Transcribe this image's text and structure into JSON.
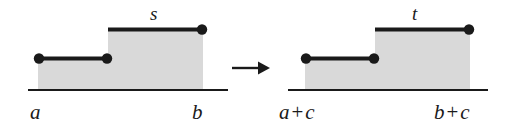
{
  "figure": {
    "background_color": "#ffffff",
    "ink_color": "#1a1a1a",
    "fill_color": "#d9d9d9",
    "panels": [
      {
        "name": "left-panel",
        "function_label": "s",
        "left_label": "a",
        "right_label": "b",
        "baseline": {
          "x1": 28,
          "x2": 228,
          "y": 90
        },
        "steps": [
          {
            "x1": 38,
            "x2": 108,
            "y": 58,
            "left_dot": true,
            "right_dot": true
          },
          {
            "x1": 108,
            "x2": 203,
            "y": 29,
            "left_dot": false,
            "right_dot": true
          }
        ]
      },
      {
        "name": "right-panel",
        "function_label": "t",
        "left_label": "a + c",
        "right_label": "b + c",
        "baseline": {
          "x1": 288,
          "x2": 488,
          "y": 90
        },
        "steps": [
          {
            "x1": 305,
            "x2": 375,
            "y": 58,
            "left_dot": true,
            "right_dot": true
          },
          {
            "x1": 375,
            "x2": 470,
            "y": 29,
            "left_dot": false,
            "right_dot": true
          }
        ]
      }
    ],
    "arrow": {
      "name": "transform-arrow",
      "x1": 232,
      "x2": 268,
      "y": 68
    },
    "labels": {
      "s": "s",
      "t": "t",
      "a": "a",
      "b": "b",
      "a_plus_c_lhs": "a",
      "a_plus_c_op": "+",
      "a_plus_c_rhs": "c",
      "b_plus_c_lhs": "b",
      "b_plus_c_op": "+",
      "b_plus_c_rhs": "c"
    }
  }
}
